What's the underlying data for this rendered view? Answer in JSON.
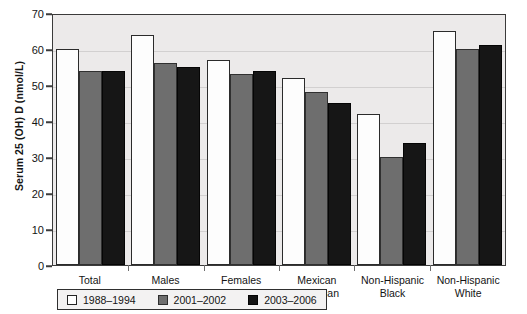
{
  "chart_data": {
    "type": "bar",
    "title": "",
    "xlabel": "",
    "ylabel": "Serum 25 (OH) D (nmol/L)",
    "ylim": [
      0,
      70
    ],
    "yticks": [
      0,
      10,
      20,
      30,
      40,
      50,
      60,
      70
    ],
    "grid": true,
    "legend_position": "bottom-left-inside",
    "categories": [
      [
        "Total",
        "Population"
      ],
      [
        "Males",
        ""
      ],
      [
        "Females",
        ""
      ],
      [
        "Mexican",
        "American"
      ],
      [
        "Non-Hispanic",
        "Black"
      ],
      [
        "Non-Hispanic",
        "White"
      ]
    ],
    "category_labels": [
      "Total Population",
      "Males",
      "Females",
      "Mexican American",
      "Non-Hispanic Black",
      "Non-Hispanic White"
    ],
    "series": [
      {
        "name": "1988-1994",
        "color": "#ffffff",
        "values": [
          60,
          64,
          57,
          52,
          42,
          65
        ]
      },
      {
        "name": "2001-2002",
        "color": "#6e6e6e",
        "values": [
          54,
          56,
          53,
          48,
          30,
          60
        ]
      },
      {
        "name": "2003-2006",
        "color": "#141414",
        "values": [
          54,
          55,
          54,
          45,
          34,
          61
        ]
      }
    ]
  },
  "legend": {
    "items": [
      {
        "label": "1988-1994"
      },
      {
        "label": "2001-2002"
      },
      {
        "label": "2003-2006"
      }
    ]
  }
}
